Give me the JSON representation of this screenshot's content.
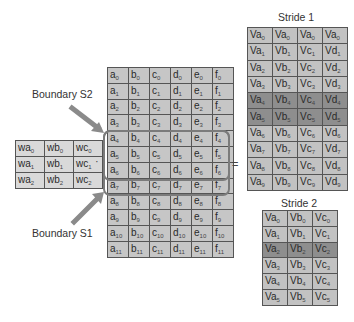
{
  "weights": {
    "rows": [
      [
        "wa0",
        "wb0",
        "wc0"
      ],
      [
        "wa1",
        "wb1",
        "wc1"
      ],
      [
        "wa2",
        "wb2",
        "wc2"
      ]
    ],
    "cells": [
      [
        {
          "b": "wa",
          "s": "0"
        },
        {
          "b": "wb",
          "s": "0"
        },
        {
          "b": "wc",
          "s": "0"
        }
      ],
      [
        {
          "b": "wa",
          "s": "1"
        },
        {
          "b": "wb",
          "s": "1"
        },
        {
          "b": "wc",
          "s": "1"
        }
      ],
      [
        {
          "b": "wa",
          "s": "2"
        },
        {
          "b": "wb",
          "s": "2"
        },
        {
          "b": "wc",
          "s": "2"
        }
      ]
    ]
  },
  "operators": {
    "multiply": "·",
    "equals": "="
  },
  "input": {
    "columns": [
      "a",
      "b",
      "c",
      "d",
      "e",
      "f"
    ],
    "row_count": 12
  },
  "labels": {
    "boundary_s2": "Boundary S2",
    "boundary_s1": "Boundary S1"
  },
  "stride1": {
    "title": "Stride 1",
    "rows": [
      [
        {
          "b": "Va",
          "s": "0"
        },
        {
          "b": "Va",
          "s": "0"
        },
        {
          "b": "Va",
          "s": "0"
        },
        {
          "b": "Va",
          "s": "0"
        }
      ],
      [
        {
          "b": "Va",
          "s": "1"
        },
        {
          "b": "Vb",
          "s": "1"
        },
        {
          "b": "Vc",
          "s": "1"
        },
        {
          "b": "Vd",
          "s": "1"
        }
      ],
      [
        {
          "b": "Va",
          "s": "2"
        },
        {
          "b": "Vb",
          "s": "2"
        },
        {
          "b": "Vc",
          "s": "2"
        },
        {
          "b": "Vd",
          "s": "2"
        }
      ],
      [
        {
          "b": "Va",
          "s": "3"
        },
        {
          "b": "Vb",
          "s": "3"
        },
        {
          "b": "Vc",
          "s": "3"
        },
        {
          "b": "Vd",
          "s": "3"
        }
      ],
      [
        {
          "b": "Va",
          "s": "4"
        },
        {
          "b": "Vb",
          "s": "4"
        },
        {
          "b": "Vc",
          "s": "4"
        },
        {
          "b": "Vd",
          "s": "4"
        }
      ],
      [
        {
          "b": "Va",
          "s": "5"
        },
        {
          "b": "Vb",
          "s": "5"
        },
        {
          "b": "Vc",
          "s": "5"
        },
        {
          "b": "Vd",
          "s": "5"
        }
      ],
      [
        {
          "b": "Va",
          "s": "6"
        },
        {
          "b": "Vb",
          "s": "6"
        },
        {
          "b": "Vc",
          "s": "6"
        },
        {
          "b": "Vd",
          "s": "6"
        }
      ],
      [
        {
          "b": "Va",
          "s": "7"
        },
        {
          "b": "Vb",
          "s": "7"
        },
        {
          "b": "Vc",
          "s": "7"
        },
        {
          "b": "Vd",
          "s": "7"
        }
      ],
      [
        {
          "b": "Va",
          "s": "8"
        },
        {
          "b": "Vb",
          "s": "8"
        },
        {
          "b": "Vc",
          "s": "8"
        },
        {
          "b": "Vd",
          "s": "8"
        }
      ],
      [
        {
          "b": "Va",
          "s": "9"
        },
        {
          "b": "Vb",
          "s": "9"
        },
        {
          "b": "Vc",
          "s": "9"
        },
        {
          "b": "Vd",
          "s": "9"
        }
      ]
    ],
    "highlighted_rows": [
      4,
      5
    ]
  },
  "stride2": {
    "title": "Stride 2",
    "rows": [
      [
        {
          "b": "Va",
          "s": "0"
        },
        {
          "b": "Vb",
          "s": "0"
        },
        {
          "b": "Vc",
          "s": "0"
        }
      ],
      [
        {
          "b": "Va",
          "s": "1"
        },
        {
          "b": "Vb",
          "s": "1"
        },
        {
          "b": "Vc",
          "s": "1"
        }
      ],
      [
        {
          "b": "Va",
          "s": "2"
        },
        {
          "b": "Vb",
          "s": "2"
        },
        {
          "b": "Vc",
          "s": "2"
        }
      ],
      [
        {
          "b": "Va",
          "s": "3"
        },
        {
          "b": "Vb",
          "s": "3"
        },
        {
          "b": "Vc",
          "s": "3"
        }
      ],
      [
        {
          "b": "Va",
          "s": "4"
        },
        {
          "b": "Vb",
          "s": "4"
        },
        {
          "b": "Vc",
          "s": "4"
        }
      ],
      [
        {
          "b": "Va",
          "s": "5"
        },
        {
          "b": "Vb",
          "s": "5"
        },
        {
          "b": "Vc",
          "s": "5"
        }
      ]
    ],
    "highlighted_rows": [
      2
    ]
  },
  "colors": {
    "cell_light": "#c6c6c6",
    "cell_highlight": "#8e8e8e",
    "weight_cell": "#d9d9d9",
    "arrow": "#8a8a8a",
    "selection_border": "#7b7b7b",
    "grid_line": "#555555"
  }
}
